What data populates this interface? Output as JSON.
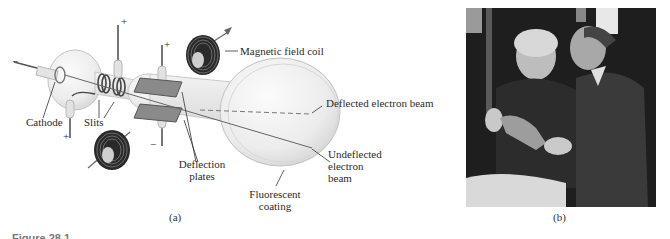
{
  "figure": {
    "panel_a": {
      "sublabel": "(a)",
      "labels": {
        "magnetic_field_coil": "Magnetic field coil",
        "deflected_beam": "Deflected electron beam",
        "undeflected_beam_line1": "Undeflected",
        "undeflected_beam_line2": "electron",
        "undeflected_beam_line3": "beam",
        "cathode": "Cathode",
        "slits": "Slits",
        "deflection_plates_line1": "Deflection",
        "deflection_plates_line2": "plates",
        "fluorescent_coating_line1": "Fluorescent",
        "fluorescent_coating_line2": "coating"
      },
      "polarity": {
        "cathode_terminal": "−",
        "anode_top": "+",
        "anode_bottom": "+",
        "plate_top": "+",
        "plate_bottom": "−"
      }
    },
    "panel_b": {
      "sublabel": "(b)",
      "description": "Photograph of two men examining a glass tube"
    },
    "caption_partial": "Figure 28.1"
  }
}
